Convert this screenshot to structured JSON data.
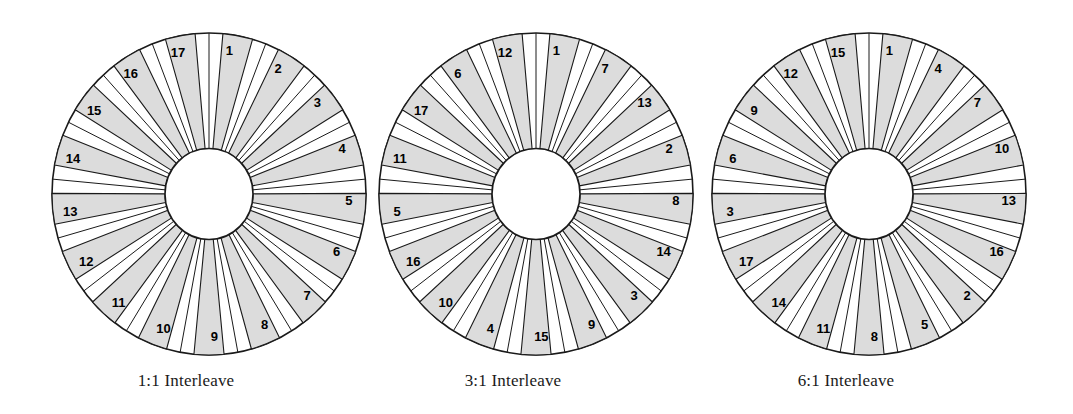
{
  "figure": {
    "background_color": "#ffffff",
    "sector_fill_color": "#dcdcdc",
    "sector_stroke_color": "#1a1a1a",
    "platter_fill_color": "#ffffff",
    "platter_stroke_color": "#1a1a1a",
    "hub_fill_color": "#ffffff",
    "hub_stroke_color": "#1a1a1a",
    "label_color": "#000000",
    "sector_count": 17
  },
  "disks": [
    {
      "id": "disk-1-1",
      "caption": "1:1 Interleave",
      "interleave": "1:1",
      "center_x": 209,
      "center_y": 194,
      "radius": 157,
      "hub_radius": 44,
      "sector_labels": [
        1,
        2,
        3,
        4,
        5,
        6,
        7,
        8,
        9,
        10,
        11,
        12,
        13,
        14,
        15,
        16,
        17
      ],
      "caption_center_x": 186,
      "caption_y": 371
    },
    {
      "id": "disk-3-1",
      "caption": "3:1 Interleave",
      "interleave": "3:1",
      "center_x": 536,
      "center_y": 194,
      "radius": 157,
      "hub_radius": 44,
      "sector_labels": [
        1,
        7,
        13,
        2,
        8,
        14,
        3,
        9,
        15,
        4,
        10,
        16,
        5,
        11,
        17,
        6,
        12
      ],
      "caption_center_x": 513,
      "caption_y": 371
    },
    {
      "id": "disk-6-1",
      "caption": "6:1 Interleave",
      "interleave": "6:1",
      "center_x": 869,
      "center_y": 194,
      "radius": 157,
      "hub_radius": 44,
      "sector_labels": [
        1,
        4,
        7,
        10,
        13,
        16,
        2,
        5,
        8,
        11,
        14,
        17,
        3,
        6,
        9,
        12,
        15
      ],
      "caption_center_x": 846,
      "caption_y": 371
    }
  ]
}
